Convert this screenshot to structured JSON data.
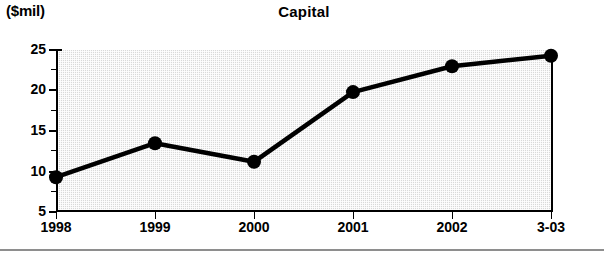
{
  "chart_data": {
    "type": "line",
    "title": "Capital",
    "units_label": "($mil)",
    "xlabel": "",
    "ylabel": "",
    "categories": [
      "1998",
      "1999",
      "2000",
      "2001",
      "2002",
      "3-03"
    ],
    "values": [
      9.3,
      13.5,
      11.2,
      19.8,
      23.0,
      24.3
    ],
    "series": [
      {
        "name": "Capital",
        "values": [
          9.3,
          13.5,
          11.2,
          19.8,
          23.0,
          24.3
        ]
      }
    ],
    "ylim": [
      5,
      25
    ],
    "ytick_labels": [
      "25",
      "20",
      "15",
      "10",
      "5"
    ],
    "ytick_values": [
      25,
      20,
      15,
      10,
      5
    ],
    "yminor_values": [
      22.5,
      17.5,
      12.5,
      7.5
    ],
    "grid": false,
    "legend": "none",
    "marker": "filled-circle",
    "colors": {
      "line": "#000000",
      "marker": "#000000",
      "plot_background": "#d9d9d9",
      "axis": "#000000",
      "text": "#000000",
      "footer_rule": "#8e8e8e"
    }
  }
}
